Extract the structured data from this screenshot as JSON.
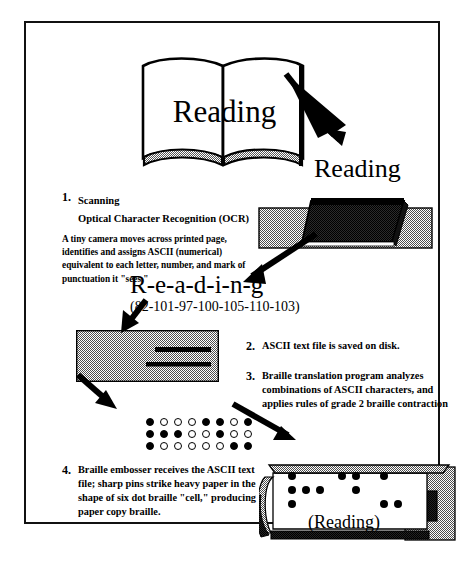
{
  "diagram": {
    "title_word": "Reading",
    "book": {
      "page_text": "Reading"
    },
    "scanned_word": "Reading",
    "split_word": "R-e-a-d-i-n-g",
    "ascii_codes": "(82-101-97-100-105-110-103)",
    "steps": [
      {
        "number": "1.",
        "heading_line1": "Scanning",
        "heading_line2": "Optical Character Recognition (OCR)",
        "body": "A tiny camera moves across printed page, identifies  and assigns ASCII (numerical) equivalent to each letter, number, and mark of punctuation it \"sees.\""
      },
      {
        "number": "2.",
        "text": "ASCII text file is saved on disk."
      },
      {
        "number": "3.",
        "text": "Braille translation program analyzes combinations of ASCII characters, and applies rules of grade 2 braille contraction"
      },
      {
        "number": "4.",
        "text": "Braille embosser receives the ASCII text file; sharp pins strike heavy paper in the shape of six dot braille \"cell,\" producing paper copy braille."
      }
    ],
    "braille_grid": {
      "rows": 3,
      "columns": 8,
      "cells": [
        [
          1,
          0,
          0,
          0,
          1,
          1,
          0,
          1
        ],
        [
          1,
          1,
          1,
          0,
          0,
          1,
          0,
          0
        ],
        [
          1,
          0,
          0,
          0,
          0,
          0,
          1,
          1
        ]
      ]
    },
    "embosser": {
      "output_word": "(Reading)",
      "dots": [
        {
          "x": 0,
          "y": 0
        },
        {
          "x": 0,
          "y": 14
        },
        {
          "x": 14,
          "y": 14
        },
        {
          "x": 28,
          "y": 14
        },
        {
          "x": 0,
          "y": 28
        },
        {
          "x": 50,
          "y": 0
        },
        {
          "x": 64,
          "y": 0
        },
        {
          "x": 64,
          "y": 14
        },
        {
          "x": 92,
          "y": 0
        },
        {
          "x": 92,
          "y": 28
        },
        {
          "x": 106,
          "y": 28
        }
      ]
    },
    "colors": {
      "ink": "#000000",
      "page": "#ffffff",
      "device_gray": "#a8a8a8",
      "device_dark": "#3a3a3a",
      "frame": "#111111"
    }
  }
}
